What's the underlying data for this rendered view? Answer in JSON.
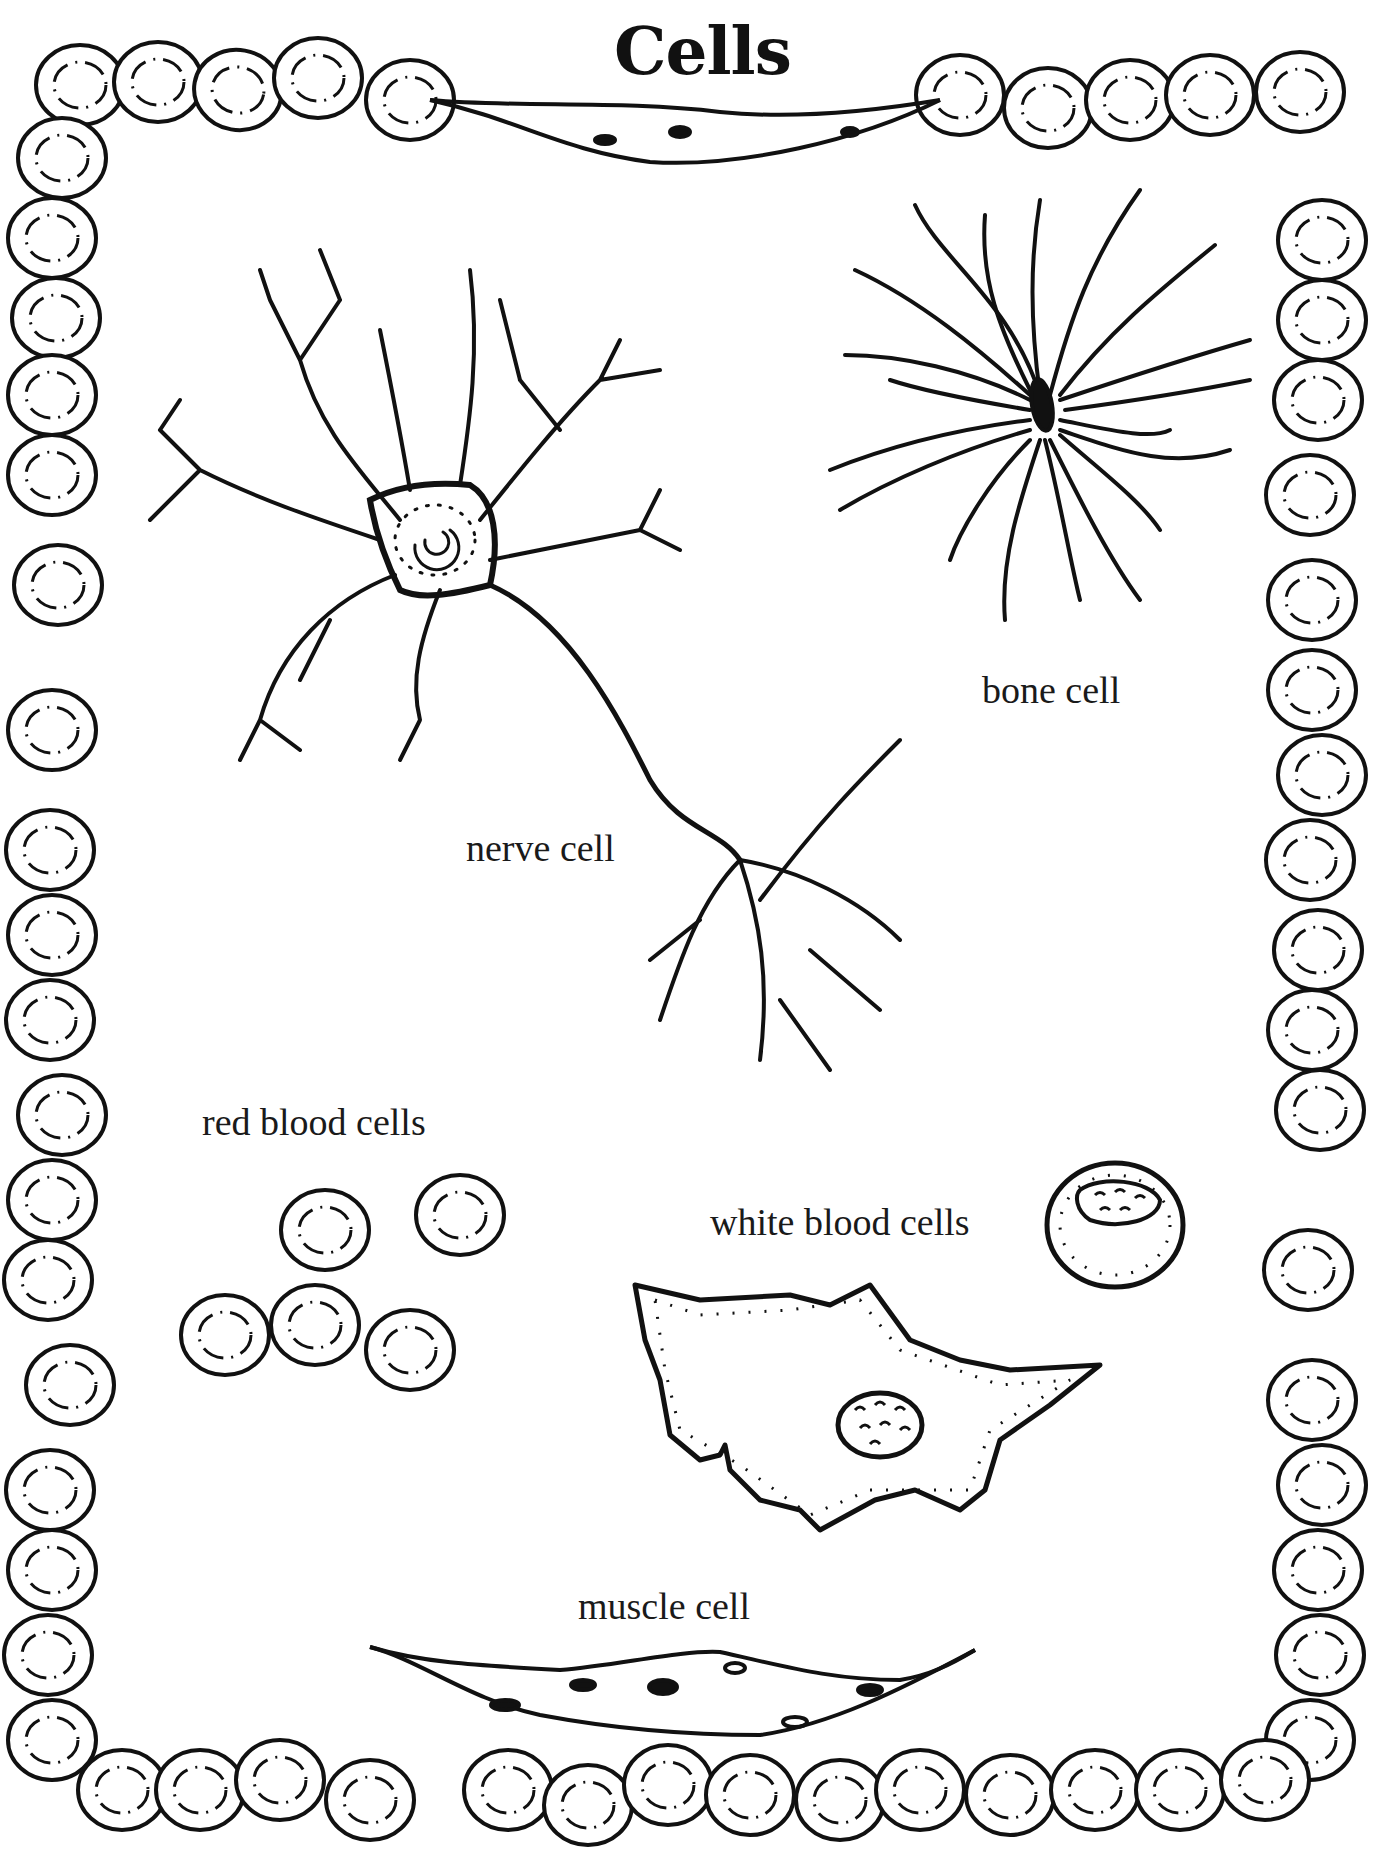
{
  "page": {
    "title": "Cells",
    "labels": {
      "nerve": "nerve cell",
      "bone": "bone cell",
      "red_blood": "red blood cells",
      "white_blood": "white blood cells",
      "muscle": "muscle cell"
    },
    "colors": {
      "ink": "#111111",
      "paper": "#ffffff"
    }
  }
}
